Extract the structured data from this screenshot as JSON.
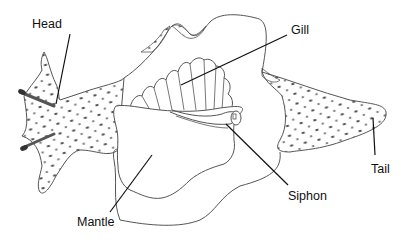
{
  "diagram": {
    "labels": [
      {
        "id": "head",
        "text": "Head",
        "x": 32,
        "y": 18
      },
      {
        "id": "gill",
        "text": "Gill",
        "x": 291,
        "y": 24
      },
      {
        "id": "tail",
        "text": "Tail",
        "x": 371,
        "y": 163
      },
      {
        "id": "siphon",
        "text": "Siphon",
        "x": 288,
        "y": 190
      },
      {
        "id": "mantle",
        "text": "Mantle",
        "x": 77,
        "y": 216
      }
    ]
  },
  "colors": {
    "outline": "#555555",
    "leader": "#111111",
    "spots": "#444444",
    "background": "#ffffff"
  }
}
